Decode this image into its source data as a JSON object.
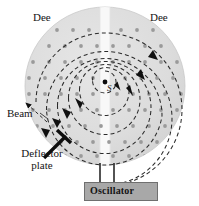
{
  "figure": {
    "type": "cyclotron-schematic",
    "title": "",
    "width": 199,
    "height": 206,
    "background": "#ffffff"
  },
  "labels": {
    "dee_left": "Dee",
    "dee_right": "Dee",
    "source": "S",
    "beam": "Beam",
    "deflector": "Deflector\nplate",
    "deflector_line1": "Deflector",
    "deflector_line2": "plate",
    "oscillator": "Oscillator"
  },
  "colors": {
    "dee_fill": "#dcdcdc",
    "dee_edge": "#c4c4c4",
    "gap_fill": "#f7f7f7",
    "spiral_stroke": "#2b2b2b",
    "field_dot": "#9a9a9a",
    "oscillator_fill": "#a8a8a8",
    "oscillator_edge": "#6f6f6f",
    "lead_line": "#1a1a1a",
    "text": "#141414"
  },
  "geometry": {
    "disc_center_x": 105,
    "disc_center_y": 86,
    "disc_radius_x": 80,
    "disc_radius_y": 79,
    "gap_left_x": 100,
    "gap_right_x": 110,
    "source_dot_x": 105,
    "source_dot_y": 82,
    "oscillator_box": {
      "x": 84,
      "y": 182,
      "w": 74,
      "h": 19
    },
    "lead_left_x": 100,
    "lead_right_x": 113,
    "lead_top_y": 163,
    "lead_bottom_y": 182
  },
  "spiral": {
    "description": "dashed outward-spiraling particle path, clockwise",
    "turn_radii": [
      11,
      23,
      34,
      45,
      56,
      67,
      77
    ],
    "dash_pattern": "4 3",
    "arrow_count": 8,
    "direction": "clockwise"
  },
  "field_dots": {
    "meaning": "magnetic-field-out-of-page",
    "rows": 10,
    "columns": 10,
    "spacing": 16,
    "radius": 1.8
  },
  "annotations": [
    {
      "name": "beam-arrow",
      "from": [
        46,
        121
      ],
      "to": [
        24,
        101
      ]
    },
    {
      "name": "deflector-plate-arrow",
      "from": [
        43,
        160
      ],
      "to": [
        62,
        138
      ]
    }
  ]
}
